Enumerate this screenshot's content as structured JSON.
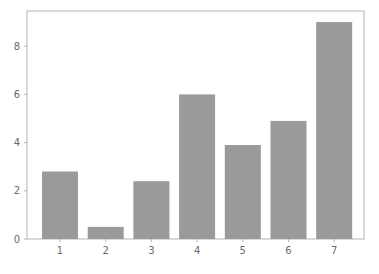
{
  "chart_data": {
    "type": "bar",
    "title": "",
    "xlabel": "",
    "ylabel": "",
    "categories": [
      "1",
      "2",
      "3",
      "4",
      "5",
      "6",
      "7"
    ],
    "values": [
      2.8,
      0.5,
      2.4,
      6.0,
      3.9,
      4.9,
      9.0
    ],
    "ylim": [
      0,
      9.45
    ],
    "yticks": [
      0,
      2,
      4,
      6,
      8
    ],
    "ytick_labels": [
      "0",
      "2",
      "4",
      "6",
      "8"
    ],
    "grid": false,
    "legend": null,
    "bar_color": "#9a9a9a",
    "axis_color": "#b5b5b5",
    "text_color": "#6a6a6a"
  }
}
